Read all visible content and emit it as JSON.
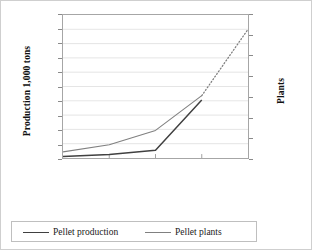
{
  "chart_data": {
    "type": "line",
    "title": "",
    "categories": [
      "2003",
      "2004",
      "2005",
      "2006 (estimated)",
      "2007 (forecast)"
    ],
    "series": [
      {
        "name": "Pellet production",
        "axis": "left",
        "color": "#404040",
        "values": [
          10,
          25,
          55,
          405,
          null
        ],
        "style": "solid"
      },
      {
        "name": "Pellet plants",
        "axis": "right",
        "color": "#808080",
        "values": [
          6,
          13,
          27,
          61,
          126
        ],
        "left_axis_equivalent": [
          40,
          90,
          190,
          430,
          900
        ],
        "style": "solid-then-dotted",
        "dotted_from_category": "2006 (estimated)"
      }
    ],
    "left_axis": {
      "label": "Production 1,000 tons",
      "min": 0,
      "max": 1000,
      "step": 100,
      "ticks": [
        "0",
        "100",
        "200",
        "300",
        "400",
        "500",
        "600",
        "700",
        "800",
        "900",
        "1000"
      ]
    },
    "right_axis": {
      "label": "Plants",
      "min": 0,
      "max": 140,
      "step": 20,
      "ticks": [
        "0",
        "20",
        "40",
        "60",
        "80",
        "100",
        "120",
        "140"
      ]
    },
    "xlabel": "",
    "grid": true,
    "grid_color": "#d9d9d9",
    "legend_position": "bottom",
    "legend": [
      {
        "label": "Pellet production",
        "color": "#404040"
      },
      {
        "label": "Pellet plants",
        "color": "#808080"
      }
    ]
  }
}
